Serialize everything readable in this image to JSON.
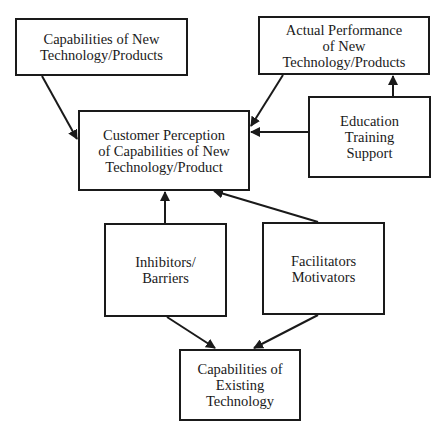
{
  "diagram": {
    "nodes": [
      {
        "id": "cap_new",
        "label": "Capabilities of New\nTechnology/Products",
        "x": 15,
        "y": 18,
        "w": 173,
        "h": 58
      },
      {
        "id": "actual_perf",
        "label": "Actual Performance\nof New\nTechnology/Products",
        "x": 258,
        "y": 16,
        "w": 172,
        "h": 59
      },
      {
        "id": "customer_perception",
        "label": "Customer Perception\nof Capabilities of New\nTechnology/Product",
        "x": 78,
        "y": 110,
        "w": 172,
        "h": 81
      },
      {
        "id": "education",
        "label": "Education\nTraining\nSupport",
        "x": 308,
        "y": 96,
        "w": 123,
        "h": 82
      },
      {
        "id": "inhibitors",
        "label": "Inhibitors/\nBarriers",
        "x": 104,
        "y": 223,
        "w": 123,
        "h": 94
      },
      {
        "id": "facilitators",
        "label": "Facilitators\nMotivators",
        "x": 262,
        "y": 222,
        "w": 123,
        "h": 93
      },
      {
        "id": "cap_existing",
        "label": "Capabilities of\nExisting\nTechnology",
        "x": 179,
        "y": 349,
        "w": 122,
        "h": 72
      }
    ],
    "edges": [
      {
        "from": "cap_new",
        "to": "customer_perception",
        "x1": 42,
        "y1": 76,
        "x2": 77,
        "y2": 139
      },
      {
        "from": "actual_perf",
        "to": "customer_perception",
        "x1": 283,
        "y1": 75,
        "x2": 251,
        "y2": 126
      },
      {
        "from": "education",
        "to": "customer_perception",
        "x1": 308,
        "y1": 132,
        "x2": 251,
        "y2": 132
      },
      {
        "from": "education",
        "to": "actual_perf",
        "x1": 393,
        "y1": 96,
        "x2": 393,
        "y2": 76
      },
      {
        "from": "inhibitors",
        "to": "customer_perception",
        "x1": 165,
        "y1": 223,
        "x2": 165,
        "y2": 192
      },
      {
        "from": "facilitators",
        "to": "customer_perception",
        "x1": 318,
        "y1": 222,
        "x2": 214,
        "y2": 191
      },
      {
        "from": "inhibitors",
        "to": "cap_existing",
        "x1": 167,
        "y1": 317,
        "x2": 215,
        "y2": 348
      },
      {
        "from": "facilitators",
        "to": "cap_existing",
        "x1": 318,
        "y1": 315,
        "x2": 254,
        "y2": 348
      }
    ],
    "colors": {
      "stroke": "#1a1a1a",
      "background": "#ffffff"
    }
  }
}
